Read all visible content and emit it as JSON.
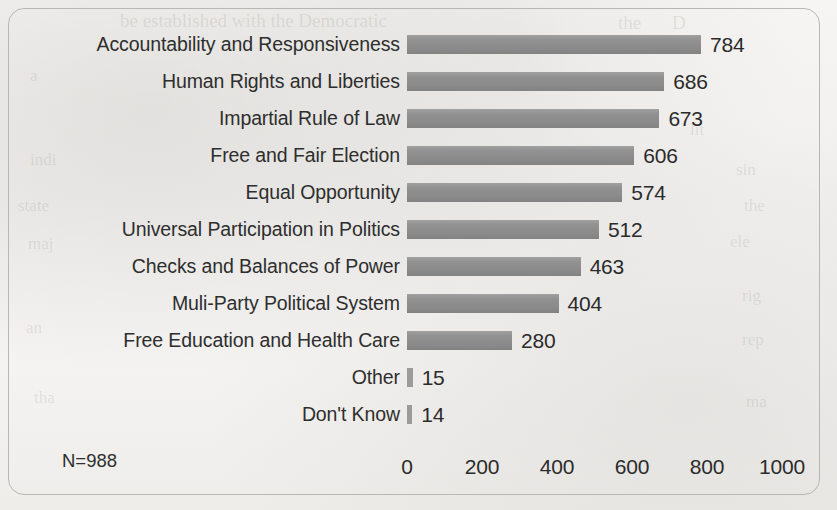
{
  "chart_data": {
    "type": "bar",
    "orientation": "horizontal",
    "title": "",
    "xlabel": "",
    "ylabel": "",
    "xlim": [
      0,
      1000
    ],
    "xticks": [
      "0",
      "200",
      "400",
      "600",
      "800",
      "1000"
    ],
    "xtick_values": [
      0,
      200,
      400,
      600,
      800,
      1000
    ],
    "grid": false,
    "legend": "none",
    "bar_color": "#919191",
    "categories": [
      "Accountability and Responsiveness",
      "Human Rights and Liberties",
      "Impartial Rule of Law",
      "Free and Fair Election",
      "Equal Opportunity",
      "Universal Participation in Politics",
      "Checks and Balances of Power",
      "Muli-Party Political System",
      "Free Education and Health Care",
      "Other",
      "Don't Know"
    ],
    "values": [
      784,
      686,
      673,
      606,
      574,
      512,
      463,
      404,
      280,
      15,
      14
    ],
    "value_labels": [
      "784",
      "686",
      "673",
      "606",
      "574",
      "512",
      "463",
      "404",
      "280",
      "15",
      "14"
    ],
    "annotation": "N=988"
  },
  "bleed_text": [
    {
      "text": "be established with the Democratic",
      "x": 120,
      "y": 10,
      "size": 19
    },
    {
      "text": "the",
      "x": 618,
      "y": 12,
      "size": 19
    },
    {
      "text": "D",
      "x": 672,
      "y": 12,
      "size": 19
    },
    {
      "text": "a",
      "x": 30,
      "y": 66,
      "size": 17
    },
    {
      "text": "lit",
      "x": 690,
      "y": 120,
      "size": 17
    },
    {
      "text": "indi",
      "x": 30,
      "y": 150,
      "size": 17
    },
    {
      "text": "state",
      "x": 18,
      "y": 196,
      "size": 17
    },
    {
      "text": "maj",
      "x": 28,
      "y": 234,
      "size": 17
    },
    {
      "text": "sin",
      "x": 736,
      "y": 160,
      "size": 17
    },
    {
      "text": "the",
      "x": 744,
      "y": 196,
      "size": 17
    },
    {
      "text": "ele",
      "x": 730,
      "y": 232,
      "size": 17
    },
    {
      "text": "rig",
      "x": 742,
      "y": 286,
      "size": 17
    },
    {
      "text": "an",
      "x": 26,
      "y": 318,
      "size": 17
    },
    {
      "text": "rep",
      "x": 742,
      "y": 330,
      "size": 17
    },
    {
      "text": "tha",
      "x": 34,
      "y": 388,
      "size": 17
    },
    {
      "text": "ma",
      "x": 746,
      "y": 392,
      "size": 17
    }
  ]
}
